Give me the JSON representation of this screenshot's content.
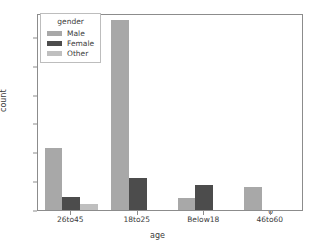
{
  "chart_data": {
    "type": "bar",
    "title": "",
    "xlabel": "age",
    "ylabel": "count",
    "categories": [
      "26to45",
      "18to25",
      "Below18",
      "46to60"
    ],
    "series": [
      {
        "name": "Male",
        "color": "#a8a8a8",
        "values": [
          215,
          660,
          40,
          80
        ]
      },
      {
        "name": "Female",
        "color": "#4c4c4c",
        "values": [
          46,
          110,
          85,
          0
        ]
      },
      {
        "name": "Other",
        "color": "#bfbfbf",
        "values": [
          20,
          0,
          0,
          0
        ]
      }
    ],
    "ylim": [
      0,
      683
    ],
    "yticks": [
      0,
      100,
      200,
      300,
      400,
      500,
      600
    ],
    "ytick_labels": [
      "0",
      "100",
      "200",
      "300",
      "400",
      "500",
      "600"
    ],
    "grid": false,
    "legend": {
      "title": "gender",
      "position": "upper left",
      "entries": [
        "Male",
        "Female",
        "Other"
      ]
    }
  },
  "figure": {
    "background": "#ffffff",
    "axes_color": "#8c8c8c",
    "text_color": "#3b3b3b"
  }
}
